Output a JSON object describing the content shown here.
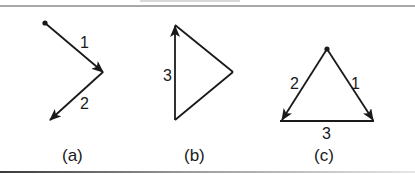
{
  "figure": {
    "colors": {
      "stroke": "#1a1a1a",
      "background": "#ffffff",
      "rule": "#555555"
    },
    "panels": [
      {
        "id": "a",
        "caption": "(a)",
        "edges": [
          {
            "label": "1",
            "from": [
              45,
              23
            ],
            "to": [
              103,
              72
            ],
            "arrow": true
          },
          {
            "label": "2",
            "from": [
              103,
              72
            ],
            "to": [
              50,
              120
            ],
            "arrow": true
          }
        ],
        "start_vertex": [
          45,
          23
        ]
      },
      {
        "id": "b",
        "caption": "(b)",
        "edges": [
          {
            "label": "",
            "from": [
              175,
              25
            ],
            "to": [
              233,
              72
            ],
            "arrow": false
          },
          {
            "label": "",
            "from": [
              233,
              72
            ],
            "to": [
              175,
              120
            ],
            "arrow": false
          },
          {
            "label": "3",
            "from": [
              175,
              120
            ],
            "to": [
              175,
              25
            ],
            "arrow": true
          }
        ]
      },
      {
        "id": "c",
        "caption": "(c)",
        "edges": [
          {
            "label": "1",
            "from": [
              327,
              49
            ],
            "to": [
              373,
              120
            ],
            "arrow": true
          },
          {
            "label": "2",
            "from": [
              327,
              49
            ],
            "to": [
              282,
              120
            ],
            "arrow": true
          },
          {
            "label": "3",
            "from": [
              282,
              121
            ],
            "to": [
              373,
              121
            ],
            "arrow": false
          }
        ],
        "start_vertex": [
          327,
          49
        ]
      }
    ]
  },
  "labels": {
    "a_edge1": "1",
    "a_edge2": "2",
    "b_edge3": "3",
    "c_edge1": "1",
    "c_edge2": "2",
    "c_edge3": "3",
    "caption_a": "(a)",
    "caption_b": "(b)",
    "caption_c": "(c)"
  }
}
